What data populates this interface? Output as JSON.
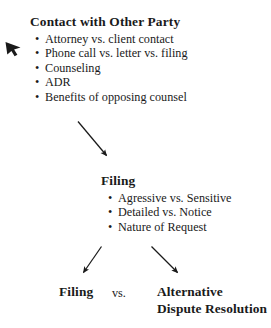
{
  "document": {
    "background_color": "#ffffff",
    "text_color": "#1a1a1a"
  },
  "contact_block": {
    "heading": "Contact with Other Party",
    "bullet_glyph": "•",
    "items": [
      "Attorney vs. client contact",
      "Phone call vs. letter vs. filing",
      "Counseling",
      "ADR",
      "Benefits of opposing counsel"
    ]
  },
  "filing_block": {
    "heading": "Filing",
    "bullet_glyph": "•",
    "items": [
      "Agressive vs. Sensitive",
      "Detailed vs. Notice",
      "Nature of Request"
    ]
  },
  "compare_block": {
    "left_label": "Filing",
    "separator": "vs.",
    "right_label": "Alternative Dispute Resolution"
  },
  "arrows": {
    "pointer_marker": "cursor-arrow-marker",
    "contact_to_filing": "arrow-down-right",
    "filing_to_left": "arrow-down-left",
    "filing_to_right": "arrow-down-right"
  }
}
